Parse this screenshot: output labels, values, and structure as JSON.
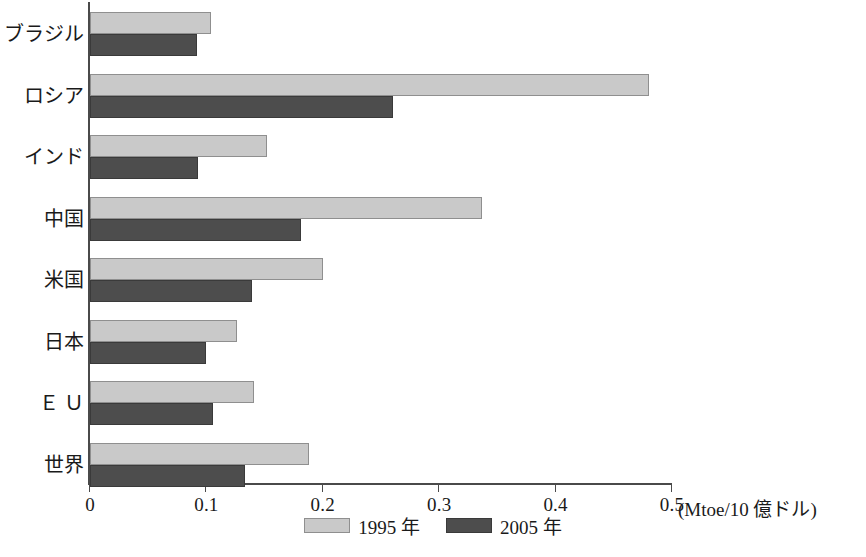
{
  "chart_data": {
    "type": "bar",
    "orientation": "horizontal",
    "title": "",
    "xlabel": "(Mtoe/10 億ドル)",
    "ylabel": "",
    "xlim": [
      0,
      0.5
    ],
    "grid": false,
    "legend_position": "bottom-center",
    "categories": [
      "ブラジル",
      "ロシア",
      "インド",
      "中国",
      "米国",
      "日本",
      "Ｅ Ｕ",
      "世界"
    ],
    "series": [
      {
        "name": "1995 年",
        "color": "#c9c9c9",
        "values": [
          0.104,
          0.48,
          0.152,
          0.337,
          0.2,
          0.126,
          0.141,
          0.188
        ]
      },
      {
        "name": "2005 年",
        "color": "#4d4d4d",
        "values": [
          0.092,
          0.26,
          0.093,
          0.181,
          0.139,
          0.1,
          0.106,
          0.133
        ]
      }
    ],
    "xticks": [
      0,
      0.1,
      0.2,
      0.3,
      0.4,
      0.5
    ],
    "xtick_labels": [
      "0",
      "0.1",
      "0.2",
      "0.3",
      "0.4",
      "0.5"
    ]
  },
  "axis": {
    "unit_caption": "(Mtoe/10 億ドル)"
  },
  "legend": {
    "items": [
      {
        "label": "1995 年"
      },
      {
        "label": "2005 年"
      }
    ]
  }
}
